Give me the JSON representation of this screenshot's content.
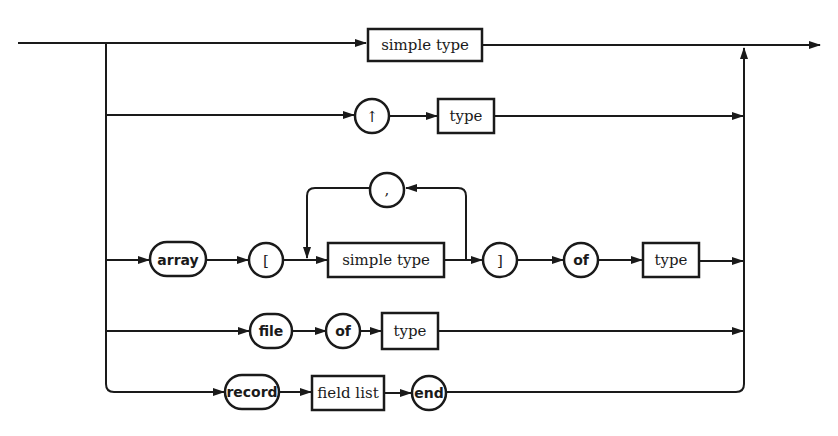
{
  "diagram": {
    "title": "type",
    "kind": "syntax-diagram",
    "colors": {
      "ink": "#1a1a1a",
      "background": "#ffffff"
    },
    "rows": [
      {
        "id": "simple",
        "nodes": [
          {
            "kind": "nonterminal",
            "label": "simple type"
          }
        ]
      },
      {
        "id": "pointer",
        "nodes": [
          {
            "kind": "terminal",
            "label": "↑"
          },
          {
            "kind": "nonterminal",
            "label": "type"
          }
        ]
      },
      {
        "id": "array",
        "nodes": [
          {
            "kind": "terminal",
            "label": "array"
          },
          {
            "kind": "terminal",
            "label": "["
          },
          {
            "kind": "nonterminal",
            "label": "simple type"
          },
          {
            "kind": "terminal",
            "label": ",",
            "loop": true
          },
          {
            "kind": "terminal",
            "label": "]"
          },
          {
            "kind": "terminal",
            "label": "of"
          },
          {
            "kind": "nonterminal",
            "label": "type"
          }
        ]
      },
      {
        "id": "file",
        "nodes": [
          {
            "kind": "terminal",
            "label": "file"
          },
          {
            "kind": "terminal",
            "label": "of"
          },
          {
            "kind": "nonterminal",
            "label": "type"
          }
        ]
      },
      {
        "id": "record",
        "nodes": [
          {
            "kind": "terminal",
            "label": "record"
          },
          {
            "kind": "nonterminal",
            "label": "field list"
          },
          {
            "kind": "terminal",
            "label": "end"
          }
        ]
      }
    ]
  }
}
